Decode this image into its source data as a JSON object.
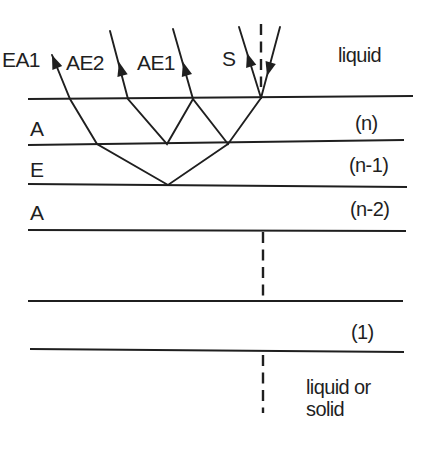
{
  "figure": {
    "canvas": {
      "width": 427,
      "height": 449
    },
    "colors": {
      "ink": "#1f1f1f",
      "background": "#ffffff"
    },
    "labels": [
      {
        "name": "label-ea1",
        "text": "EA1",
        "x": 2,
        "y": 67,
        "size": 21
      },
      {
        "name": "label-ae2",
        "text": "AE2",
        "x": 66,
        "y": 70,
        "size": 21
      },
      {
        "name": "label-ae1",
        "text": "AE1",
        "x": 137,
        "y": 70,
        "size": 21
      },
      {
        "name": "label-s",
        "text": "S",
        "x": 222,
        "y": 66,
        "size": 21
      },
      {
        "name": "label-liquid",
        "text": "liquid",
        "x": 338,
        "y": 62,
        "size": 20
      },
      {
        "name": "label-layer-a-n",
        "text": "A",
        "x": 30,
        "y": 136,
        "size": 21
      },
      {
        "name": "label-layer-e",
        "text": "E",
        "x": 30,
        "y": 177,
        "size": 21
      },
      {
        "name": "label-layer-a-n2",
        "text": "A",
        "x": 30,
        "y": 220,
        "size": 21
      },
      {
        "name": "label-layer-n",
        "text": "(n)",
        "x": 355,
        "y": 130,
        "size": 20
      },
      {
        "name": "label-layer-n-1",
        "text": "(n-1)",
        "x": 349,
        "y": 172,
        "size": 20
      },
      {
        "name": "label-layer-n-2",
        "text": "(n-2)",
        "x": 350,
        "y": 216,
        "size": 20
      },
      {
        "name": "label-layer-1",
        "text": "(1)",
        "x": 351,
        "y": 339,
        "size": 20
      },
      {
        "name": "label-liquid-or",
        "text": "liquid or",
        "x": 306,
        "y": 394,
        "size": 20
      },
      {
        "name": "label-solid",
        "text": "solid",
        "x": 306,
        "y": 416,
        "size": 20
      }
    ],
    "interfaces": [
      {
        "name": "interface-surface",
        "x1": 28,
        "y1": 99,
        "x2": 413,
        "y2": 96
      },
      {
        "name": "interface-n-top",
        "x1": 28,
        "y1": 145,
        "x2": 404,
        "y2": 140
      },
      {
        "name": "interface-n-1-bottom",
        "x1": 28,
        "y1": 184,
        "x2": 407,
        "y2": 187
      },
      {
        "name": "interface-n-2-bottom",
        "x1": 28,
        "y1": 230,
        "x2": 406,
        "y2": 231
      },
      {
        "name": "interface-1-top",
        "x1": 28,
        "y1": 301,
        "x2": 403,
        "y2": 301
      },
      {
        "name": "interface-1-bottom",
        "x1": 30,
        "y1": 349,
        "x2": 404,
        "y2": 352
      }
    ],
    "dashed_lines": [
      {
        "name": "normal-at-source",
        "x": 261,
        "y1": 24,
        "y2": 87
      },
      {
        "name": "normal-continuation-mid",
        "x": 263,
        "y1": 232,
        "y2": 301
      },
      {
        "name": "normal-continuation-low",
        "x": 263,
        "y1": 355,
        "y2": 413
      }
    ],
    "rays": [
      {
        "name": "ray-s-incident",
        "points": [
          [
            280,
            27
          ],
          [
            261,
            98
          ]
        ]
      },
      {
        "name": "ray-s-reflected",
        "points": [
          [
            261,
            98
          ],
          [
            239,
            27
          ]
        ]
      },
      {
        "name": "ray-ae1",
        "points": [
          [
            261,
            98
          ],
          [
            228,
            144
          ],
          [
            193,
            99
          ],
          [
            173,
            29
          ]
        ]
      },
      {
        "name": "ray-ae2",
        "points": [
          [
            193,
            99
          ],
          [
            167,
            144
          ],
          [
            128,
            99
          ],
          [
            110,
            31
          ]
        ]
      },
      {
        "name": "ray-ea1",
        "points": [
          [
            228,
            144
          ],
          [
            168,
            185
          ],
          [
            97,
            144
          ],
          [
            70,
            99
          ],
          [
            52,
            55
          ]
        ]
      }
    ],
    "arrowheads": [
      {
        "name": "arrowhead-ea1",
        "tip": [
          52,
          55
        ],
        "dx": -18,
        "dy": -44
      },
      {
        "name": "arrowhead-ae2",
        "tip": [
          119,
          62
        ],
        "dx": -18,
        "dy": -69
      },
      {
        "name": "arrowhead-ae1",
        "tip": [
          183,
          62
        ],
        "dx": -20,
        "dy": -69
      },
      {
        "name": "arrowhead-s-reflected",
        "tip": [
          247,
          53
        ],
        "dx": -22,
        "dy": -70
      },
      {
        "name": "arrowhead-s-incident",
        "tip": [
          267,
          76
        ],
        "dx": -19,
        "dy": 70
      }
    ]
  }
}
